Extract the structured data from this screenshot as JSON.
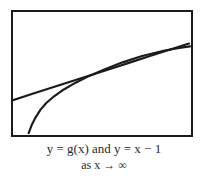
{
  "figure": {
    "background_color": "#ffffff",
    "frame": {
      "border_color": "#1b1b1b",
      "border_width_px": 2,
      "fill_color": "#ffffff"
    },
    "caption": {
      "line1": "y = g(x) and y = x − 1",
      "line2": "as x → ∞",
      "text_color": "#2a2a2a"
    }
  },
  "chart_data": {
    "type": "line",
    "title": "y = g(x) and y = x − 1",
    "subtitle": "as x → ∞",
    "xlabel": "",
    "ylabel": "",
    "grid": false,
    "legend": "none",
    "axes_visible": false,
    "xlim": [
      0,
      182
    ],
    "ylim": [
      0,
      127
    ],
    "annotations": [
      "as x → ∞"
    ],
    "series": [
      {
        "name": "y = x − 1",
        "color": "#1b1b1b",
        "style": "solid",
        "width_px": 2,
        "points": [
          [
            0,
            91
          ],
          [
            20,
            84.5
          ],
          [
            40,
            78
          ],
          [
            60,
            71.5
          ],
          [
            80,
            65
          ],
          [
            100,
            58.5
          ],
          [
            120,
            52
          ],
          [
            140,
            45.5
          ],
          [
            160,
            39
          ],
          [
            180,
            32.5
          ]
        ]
      },
      {
        "name": "y = g(x)",
        "color": "#1b1b1b",
        "style": "solid",
        "width_px": 2,
        "points": [
          [
            16,
            125
          ],
          [
            19,
            117
          ],
          [
            23,
            109
          ],
          [
            28,
            101
          ],
          [
            34,
            94
          ],
          [
            42,
            87
          ],
          [
            52,
            80
          ],
          [
            64,
            73
          ],
          [
            78,
            66
          ],
          [
            94,
            59
          ],
          [
            112,
            52
          ],
          [
            132,
            45.5
          ],
          [
            154,
            40
          ],
          [
            170,
            37
          ],
          [
            181,
            35.5
          ]
        ]
      }
    ]
  }
}
